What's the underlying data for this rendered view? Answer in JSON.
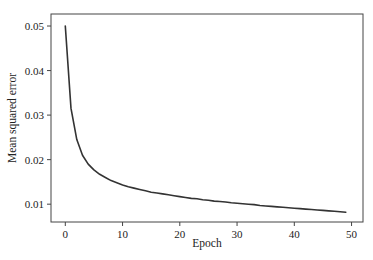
{
  "chart_data": {
    "type": "line",
    "title": "",
    "xlabel": "Epoch",
    "ylabel": "Mean squared error",
    "xlim": [
      -2.5,
      52
    ],
    "ylim": [
      0.006,
      0.0527
    ],
    "x_ticks": [
      0,
      10,
      20,
      30,
      40,
      50
    ],
    "x_tick_labels": [
      "0",
      "10",
      "20",
      "30",
      "40",
      "50"
    ],
    "y_ticks": [
      0.01,
      0.02,
      0.03,
      0.04,
      0.05
    ],
    "y_tick_labels": [
      "0.01",
      "0.02",
      "0.03",
      "0.04",
      "0.05"
    ],
    "grid": false,
    "legend": null,
    "series": [
      {
        "name": "training loss",
        "color": "#333333",
        "x": [
          0,
          1,
          2,
          3,
          4,
          5,
          6,
          7,
          8,
          9,
          10,
          11,
          12,
          13,
          14,
          15,
          16,
          17,
          18,
          19,
          20,
          21,
          22,
          23,
          24,
          25,
          26,
          27,
          28,
          29,
          30,
          31,
          32,
          33,
          34,
          35,
          36,
          37,
          38,
          39,
          40,
          41,
          42,
          43,
          44,
          45,
          46,
          47,
          48,
          49
        ],
        "values": [
          0.05,
          0.0315,
          0.0245,
          0.021,
          0.019,
          0.0177,
          0.0167,
          0.016,
          0.0153,
          0.0148,
          0.0143,
          0.0139,
          0.0136,
          0.0133,
          0.013,
          0.0127,
          0.0125,
          0.0123,
          0.0121,
          0.0119,
          0.0117,
          0.0115,
          0.0113,
          0.0112,
          0.011,
          0.0109,
          0.0107,
          0.0106,
          0.0105,
          0.0103,
          0.0102,
          0.0101,
          0.01,
          0.0099,
          0.0097,
          0.0096,
          0.0095,
          0.0094,
          0.0093,
          0.0092,
          0.0091,
          0.009,
          0.0089,
          0.0088,
          0.0087,
          0.0086,
          0.0085,
          0.0084,
          0.0083,
          0.0082
        ]
      }
    ]
  },
  "colors": {
    "line": "#333333",
    "axes": "#444444",
    "background": "#ffffff"
  }
}
